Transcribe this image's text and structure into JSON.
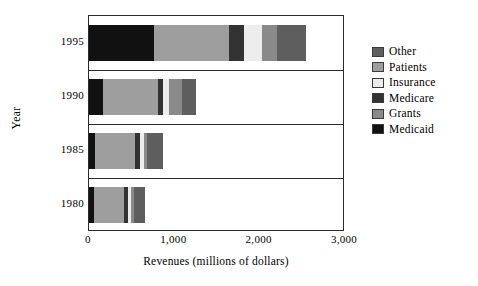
{
  "chart_data": {
    "type": "bar",
    "orientation": "horizontal",
    "stacked": true,
    "title": "",
    "xlabel": "Revenues (millions of dollars)",
    "ylabel": "Year",
    "categories": [
      "1995",
      "1990",
      "1985",
      "1980"
    ],
    "xlim": [
      0,
      3000
    ],
    "xticks": [
      0,
      1000,
      2000,
      3000
    ],
    "xticklabels": [
      "0",
      "1,000",
      "2,000",
      "3,000"
    ],
    "grid": false,
    "legend_position": "right",
    "legend_order": [
      "Other",
      "Patients",
      "Insurance",
      "Medicare",
      "Grants",
      "Medicaid"
    ],
    "stack_order": [
      "Medicaid",
      "Grants",
      "Medicare",
      "Insurance",
      "Patients",
      "Other"
    ],
    "colors": {
      "Other": "#5e5e5e",
      "Patients": "#9e9e9e",
      "Insurance": "#ededed",
      "Medicare": "#333333",
      "Grants": "#8a8a8a",
      "Medicaid": "#111111"
    },
    "series": [
      {
        "name": "Medicaid",
        "values": [
          760,
          160,
          75,
          55
        ]
      },
      {
        "name": "Grants",
        "values": [
          0,
          0,
          0,
          0
        ]
      },
      {
        "name": "Medicare",
        "values": [
          0,
          0,
          0,
          0
        ]
      },
      {
        "name": "Insurance",
        "values": [
          0,
          0,
          0,
          0
        ]
      },
      {
        "name": "Patients",
        "values": [
          0,
          0,
          0,
          0
        ]
      },
      {
        "name": "Other",
        "values": [
          0,
          0,
          0,
          0
        ]
      }
    ],
    "bars": [
      {
        "category": "1995",
        "total": 2545,
        "segments": [
          {
            "name": "Medicaid",
            "value": 760
          },
          {
            "name": "Grants",
            "value": 0
          },
          {
            "name": "Patients",
            "value": 880
          },
          {
            "name": "Medicare",
            "value": 180
          },
          {
            "name": "Insurance",
            "value": 210
          },
          {
            "name": "Grants2",
            "value": 175
          },
          {
            "name": "Other",
            "value": 340
          }
        ]
      },
      {
        "category": "1990",
        "total": 1260,
        "segments": [
          {
            "name": "Medicaid",
            "value": 160
          },
          {
            "name": "Patients",
            "value": 650
          },
          {
            "name": "Medicare",
            "value": 60
          },
          {
            "name": "Insurance",
            "value": 70
          },
          {
            "name": "Grants",
            "value": 145
          },
          {
            "name": "Other",
            "value": 175
          }
        ]
      },
      {
        "category": "1985",
        "total": 870,
        "segments": [
          {
            "name": "Medicaid",
            "value": 75
          },
          {
            "name": "Patients",
            "value": 460
          },
          {
            "name": "Medicare",
            "value": 60
          },
          {
            "name": "Insurance",
            "value": 45
          },
          {
            "name": "Grants",
            "value": 45
          },
          {
            "name": "Other",
            "value": 185
          }
        ]
      },
      {
        "category": "1980",
        "total": 655,
        "segments": [
          {
            "name": "Medicaid",
            "value": 55
          },
          {
            "name": "Patients",
            "value": 360
          },
          {
            "name": "Medicare",
            "value": 45
          },
          {
            "name": "Insurance",
            "value": 35
          },
          {
            "name": "Grants",
            "value": 30
          },
          {
            "name": "Other",
            "value": 130
          }
        ]
      }
    ]
  },
  "legend": {
    "items": [
      {
        "label": "Other",
        "color": "#5e5e5e"
      },
      {
        "label": "Patients",
        "color": "#9e9e9e"
      },
      {
        "label": "Insurance",
        "color": "#ededed"
      },
      {
        "label": "Medicare",
        "color": "#333333"
      },
      {
        "label": "Grants",
        "color": "#8a8a8a"
      },
      {
        "label": "Medicaid",
        "color": "#111111"
      }
    ]
  }
}
